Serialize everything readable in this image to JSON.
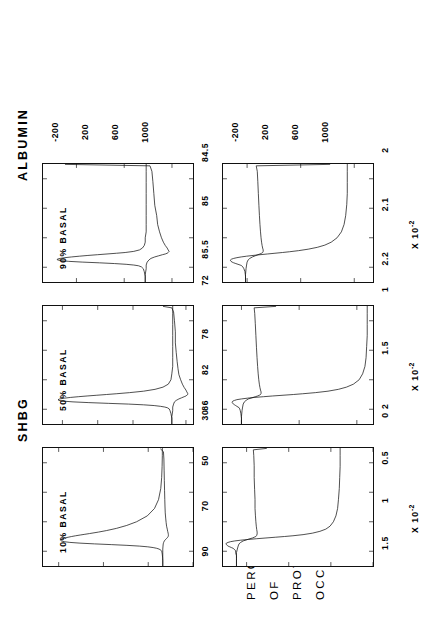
{
  "figure": {
    "axis_title_lines": [
      "PERCENTAGE",
      "OF",
      "PROTEIN",
      "OCCUPIED"
    ],
    "columns": [
      {
        "key": "shbg",
        "title": "SHBG"
      },
      {
        "key": "albumin",
        "title": "ALBUMIN"
      }
    ],
    "multiplier_label_prefix": "X 10",
    "multiplier_label_exponent": "-2"
  },
  "chart_data": [
    {
      "type": "line",
      "title": "SHBG",
      "annotation": "10% BASAL",
      "xlabel": "",
      "ylabel": "PERCENTAGE OF PROTEIN OCCUPIED",
      "xticks": [
        -200,
        200,
        600,
        1000
      ],
      "yticks": [
        90,
        70,
        50,
        30
      ],
      "xlim": [
        -400,
        1200
      ],
      "ylim": [
        30,
        97
      ],
      "grid": false,
      "legend": "none",
      "series": [
        {
          "name": "upper",
          "x": [
            -400,
            -330,
            -280,
            -250,
            -225,
            -210,
            -200,
            -190,
            -180,
            -170,
            -160,
            -150,
            -140,
            -130,
            -120,
            -110,
            -100,
            -90,
            -80,
            -70,
            -60,
            -50,
            -40,
            -30,
            -20,
            -10,
            0,
            10,
            20,
            30,
            40,
            60,
            80,
            110,
            150,
            200,
            280,
            380,
            500,
            650,
            800,
            950,
            1100,
            1200
          ],
          "y": [
            43.5,
            43.5,
            43.6,
            43.7,
            43.8,
            43.9,
            44.0,
            44.2,
            44.6,
            45.2,
            46.2,
            47.8,
            50.2,
            54.0,
            59.5,
            66.5,
            74.0,
            80.5,
            85.0,
            87.6,
            88.8,
            89.2,
            89.0,
            88.3,
            87.2,
            85.8,
            84.2,
            82.4,
            80.4,
            78.3,
            76.2,
            72.2,
            68.7,
            64.2,
            59.6,
            55.2,
            50.4,
            47.2,
            45.4,
            44.4,
            44.0,
            43.8,
            43.7,
            43.7
          ]
        },
        {
          "name": "lower",
          "x": [
            -400,
            -300,
            -220,
            -170,
            -130,
            -100,
            -80,
            -60,
            -45,
            -30,
            -20,
            -10,
            0,
            10,
            25,
            45,
            70,
            100,
            140,
            190,
            250,
            320,
            400,
            500,
            620,
            760,
            900,
            1050,
            1150,
            1190
          ],
          "y": [
            43.5,
            43.5,
            43.5,
            43.5,
            43.4,
            43.3,
            43.1,
            42.8,
            42.4,
            41.9,
            41.6,
            41.3,
            41.1,
            41.0,
            41.0,
            41.1,
            41.3,
            41.5,
            41.8,
            42.0,
            42.2,
            42.4,
            42.5,
            42.6,
            42.7,
            42.8,
            42.9,
            43.0,
            43.2,
            44.6
          ]
        }
      ]
    },
    {
      "type": "line",
      "title": "SHBG",
      "annotation": "50% BASAL",
      "xticks": [
        -200,
        200,
        600,
        1000
      ],
      "yticks": [
        86,
        82,
        78,
        72
      ],
      "xlim": [
        -400,
        1200
      ],
      "ylim": [
        71.2,
        88.2
      ],
      "grid": false,
      "legend": "none",
      "series": [
        {
          "name": "upper",
          "x": [
            -400,
            -320,
            -260,
            -220,
            -195,
            -180,
            -170,
            -160,
            -150,
            -140,
            -130,
            -120,
            -110,
            -100,
            -90,
            -80,
            -70,
            -60,
            -50,
            -40,
            -30,
            -20,
            -10,
            0,
            10,
            25,
            45,
            70,
            100,
            140,
            200,
            280,
            380,
            500,
            650,
            800,
            950,
            1100,
            1200
          ],
          "y": [
            73.6,
            73.6,
            73.7,
            73.8,
            73.9,
            74.1,
            74.4,
            74.9,
            75.6,
            76.8,
            78.5,
            80.8,
            83.0,
            84.8,
            85.9,
            86.4,
            86.5,
            86.3,
            85.8,
            85.1,
            84.2,
            83.2,
            82.1,
            81.0,
            79.9,
            78.4,
            76.8,
            75.5,
            74.6,
            74.0,
            73.7,
            73.6,
            73.5,
            73.5,
            73.5,
            73.5,
            73.5,
            73.5,
            73.5
          ]
        },
        {
          "name": "lower",
          "x": [
            -400,
            -300,
            -220,
            -170,
            -130,
            -100,
            -80,
            -60,
            -45,
            -30,
            -20,
            -10,
            0,
            15,
            35,
            60,
            95,
            140,
            200,
            270,
            350,
            450,
            570,
            700,
            850,
            1000,
            1120,
            1175,
            1195
          ],
          "y": [
            73.6,
            73.6,
            73.5,
            73.5,
            73.4,
            73.3,
            73.1,
            72.8,
            72.5,
            72.2,
            72.0,
            71.9,
            71.8,
            71.8,
            71.9,
            72.0,
            72.2,
            72.4,
            72.6,
            72.8,
            72.9,
            73.0,
            73.1,
            73.2,
            73.2,
            73.3,
            73.4,
            73.6,
            74.6
          ]
        }
      ]
    },
    {
      "type": "line",
      "title": "SHBG",
      "annotation": "90% BASAL",
      "xticks": [
        -200,
        200,
        600,
        1000
      ],
      "yticks": [
        85.5,
        85.0,
        84.5
      ],
      "xlim": [
        -400,
        1200
      ],
      "ylim": [
        84.28,
        85.85
      ],
      "grid": false,
      "legend": "none",
      "series": [
        {
          "name": "upper",
          "x": [
            -400,
            -320,
            -260,
            -220,
            -195,
            -180,
            -170,
            -160,
            -150,
            -140,
            -130,
            -120,
            -110,
            -100,
            -90,
            -80,
            -70,
            -60,
            -50,
            -40,
            -30,
            -20,
            -10,
            0,
            15,
            35,
            60,
            95,
            140,
            200,
            280,
            380,
            500,
            650,
            800,
            950,
            1100,
            1200
          ],
          "y": [
            84.78,
            84.78,
            84.79,
            84.8,
            84.82,
            84.85,
            84.9,
            84.98,
            85.1,
            85.26,
            85.44,
            85.58,
            85.66,
            85.7,
            85.7,
            85.67,
            85.62,
            85.55,
            85.47,
            85.38,
            85.28,
            85.18,
            85.08,
            84.99,
            84.9,
            84.84,
            84.81,
            84.79,
            84.78,
            84.78,
            84.77,
            84.77,
            84.77,
            84.77,
            84.77,
            84.77,
            84.77,
            84.77
          ]
        },
        {
          "name": "lower",
          "x": [
            -400,
            -300,
            -220,
            -170,
            -130,
            -100,
            -80,
            -60,
            -45,
            -30,
            -20,
            -10,
            0,
            15,
            35,
            60,
            95,
            140,
            200,
            280,
            380,
            500,
            640,
            800,
            960,
            1100,
            1175,
            1195
          ],
          "y": [
            84.78,
            84.78,
            84.77,
            84.77,
            84.76,
            84.74,
            84.72,
            84.68,
            84.64,
            84.6,
            84.57,
            84.55,
            84.54,
            84.53,
            84.54,
            84.55,
            84.57,
            84.59,
            84.61,
            84.63,
            84.65,
            84.66,
            84.68,
            84.69,
            84.7,
            84.71,
            84.73,
            85.62
          ]
        }
      ]
    },
    {
      "type": "line",
      "title": "ALBUMIN",
      "annotation": "",
      "xticks": [
        -200,
        200,
        600,
        1000
      ],
      "yticks": [
        1.5,
        1.0,
        0.5,
        0.0
      ],
      "ytick_multiplier": "X 10-2",
      "xlim": [
        -400,
        1200
      ],
      "ylim": [
        0.0,
        1.78
      ],
      "grid": false,
      "legend": "none",
      "series": [
        {
          "name": "upper",
          "x": [
            -400,
            -320,
            -260,
            -220,
            -195,
            -180,
            -170,
            -160,
            -150,
            -140,
            -130,
            -120,
            -110,
            -100,
            -90,
            -80,
            -70,
            -60,
            -50,
            -40,
            -30,
            -20,
            -10,
            0,
            10,
            25,
            45,
            70,
            100,
            140,
            200,
            280,
            380,
            500,
            650,
            800,
            950,
            1100,
            1200
          ],
          "y": [
            1.62,
            1.62,
            1.62,
            1.63,
            1.63,
            1.64,
            1.65,
            1.66,
            1.68,
            1.7,
            1.72,
            1.73,
            1.74,
            1.745,
            1.74,
            1.72,
            1.69,
            1.64,
            1.57,
            1.48,
            1.38,
            1.27,
            1.16,
            1.05,
            0.95,
            0.83,
            0.72,
            0.63,
            0.56,
            0.51,
            0.47,
            0.44,
            0.42,
            0.41,
            0.4,
            0.395,
            0.39,
            0.39,
            0.39
          ]
        },
        {
          "name": "lower",
          "x": [
            -400,
            -300,
            -220,
            -170,
            -130,
            -100,
            -80,
            -60,
            -45,
            -30,
            -20,
            -10,
            0,
            15,
            35,
            60,
            95,
            140,
            200,
            280,
            380,
            500,
            640,
            800,
            960,
            1100,
            1175,
            1195
          ],
          "y": [
            1.62,
            1.62,
            1.62,
            1.61,
            1.6,
            1.59,
            1.57,
            1.54,
            1.5,
            1.46,
            1.43,
            1.41,
            1.39,
            1.38,
            1.375,
            1.375,
            1.38,
            1.385,
            1.39,
            1.395,
            1.4,
            1.4,
            1.405,
            1.41,
            1.41,
            1.415,
            1.42,
            1.26
          ]
        }
      ]
    },
    {
      "type": "line",
      "title": "ALBUMIN",
      "annotation": "",
      "xticks": [
        -200,
        200,
        600,
        1000
      ],
      "yticks": [
        2.0,
        1.5,
        1.0
      ],
      "ytick_multiplier": "X 10-2",
      "xlim": [
        -400,
        1200
      ],
      "ylim": [
        0.86,
        2.16
      ],
      "grid": false,
      "legend": "none",
      "series": [
        {
          "name": "upper",
          "x": [
            -400,
            -320,
            -260,
            -220,
            -195,
            -180,
            -170,
            -160,
            -150,
            -140,
            -130,
            -120,
            -110,
            -100,
            -90,
            -80,
            -70,
            -60,
            -50,
            -40,
            -30,
            -20,
            -10,
            0,
            10,
            25,
            45,
            70,
            100,
            140,
            200,
            280,
            380,
            500,
            650,
            800,
            950,
            1100,
            1200
          ],
          "y": [
            2.0,
            2.0,
            2.005,
            2.01,
            2.015,
            2.02,
            2.03,
            2.04,
            2.05,
            2.06,
            2.07,
            2.075,
            2.08,
            2.08,
            2.075,
            2.06,
            2.04,
            2.0,
            1.95,
            1.89,
            1.81,
            1.73,
            1.64,
            1.55,
            1.47,
            1.36,
            1.25,
            1.16,
            1.09,
            1.03,
            0.98,
            0.95,
            0.93,
            0.92,
            0.915,
            0.91,
            0.91,
            0.91,
            0.91
          ]
        },
        {
          "name": "lower",
          "x": [
            -400,
            -300,
            -220,
            -170,
            -130,
            -100,
            -80,
            -60,
            -45,
            -30,
            -20,
            -10,
            0,
            15,
            35,
            60,
            95,
            140,
            200,
            280,
            380,
            500,
            640,
            800,
            960,
            1100,
            1175,
            1195
          ],
          "y": [
            2.0,
            2.0,
            1.995,
            1.99,
            1.985,
            1.975,
            1.96,
            1.94,
            1.91,
            1.88,
            1.86,
            1.845,
            1.835,
            1.83,
            1.83,
            1.835,
            1.84,
            1.845,
            1.85,
            1.855,
            1.86,
            1.865,
            1.87,
            1.875,
            1.88,
            1.885,
            1.89,
            1.7
          ]
        }
      ]
    },
    {
      "type": "line",
      "title": "ALBUMIN",
      "annotation": "",
      "xticks": [
        -200,
        200,
        600,
        1000
      ],
      "yticks": [
        2.2,
        2.1,
        2.0
      ],
      "ytick_multiplier": "X 10-2",
      "xlim": [
        -400,
        1200
      ],
      "ylim": [
        1.965,
        2.245
      ],
      "grid": false,
      "legend": "none",
      "series": [
        {
          "name": "upper",
          "x": [
            -400,
            -320,
            -260,
            -220,
            -195,
            -180,
            -170,
            -160,
            -150,
            -140,
            -130,
            -120,
            -110,
            -100,
            -90,
            -80,
            -70,
            -60,
            -50,
            -40,
            -30,
            -20,
            -10,
            0,
            10,
            25,
            45,
            70,
            100,
            140,
            200,
            280,
            380,
            500,
            650,
            800,
            950,
            1100,
            1200
          ],
          "y": [
            2.203,
            2.203,
            2.204,
            2.206,
            2.208,
            2.21,
            2.213,
            2.217,
            2.221,
            2.225,
            2.228,
            2.23,
            2.231,
            2.231,
            2.229,
            2.225,
            2.219,
            2.211,
            2.201,
            2.189,
            2.176,
            2.162,
            2.148,
            2.134,
            2.121,
            2.104,
            2.086,
            2.069,
            2.055,
            2.043,
            2.032,
            2.024,
            2.019,
            2.016,
            2.014,
            2.013,
            2.013,
            2.013,
            2.013
          ]
        },
        {
          "name": "lower",
          "x": [
            -400,
            -300,
            -220,
            -170,
            -130,
            -100,
            -80,
            -60,
            -45,
            -30,
            -20,
            -10,
            0,
            15,
            35,
            60,
            95,
            140,
            200,
            280,
            380,
            500,
            640,
            800,
            960,
            1100,
            1175,
            1195
          ],
          "y": [
            2.203,
            2.203,
            2.202,
            2.201,
            2.2,
            2.198,
            2.195,
            2.19,
            2.185,
            2.18,
            2.176,
            2.173,
            2.171,
            2.17,
            2.17,
            2.171,
            2.172,
            2.173,
            2.174,
            2.175,
            2.176,
            2.177,
            2.178,
            2.179,
            2.18,
            2.181,
            2.183,
            2.045
          ]
        }
      ]
    }
  ]
}
